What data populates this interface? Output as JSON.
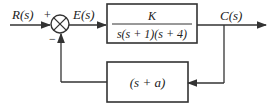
{
  "diagram": {
    "type": "block-diagram",
    "input_label": "R(s)",
    "plus_sign": "+",
    "minus_sign": "−",
    "error_label": "E(s)",
    "output_label": "C(s)",
    "forward_block": {
      "numerator": "K",
      "denominator": "s(s + 1)(s + 4)"
    },
    "feedback_block": {
      "text": "(s + a)"
    },
    "line_color": "#333333"
  }
}
